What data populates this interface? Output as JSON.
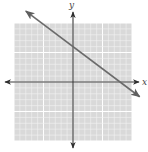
{
  "chart_data": {
    "type": "line",
    "title": "",
    "xlabel": "x",
    "ylabel": "y",
    "xlim": [
      -10,
      10
    ],
    "ylim": [
      -10,
      10
    ],
    "grid": true,
    "grid_minor_step": 1,
    "grid_major_step": 5,
    "tick_labels": false,
    "legend": null,
    "series": [
      {
        "name": "line",
        "equation": "3x + 4y = 24",
        "slope": -0.75,
        "y_intercept": 6,
        "x_intercept": 8,
        "points": [
          {
            "x": -8,
            "y": 12
          },
          {
            "x": 0,
            "y": 6
          },
          {
            "x": 8,
            "y": 0
          },
          {
            "x": 11.3,
            "y": -2.5
          }
        ],
        "arrows_both_ends": true,
        "color": "#6b6b6b"
      }
    ]
  },
  "colors": {
    "grid_background": "#d9d9d9",
    "grid_minor": "#f2f2f2",
    "grid_major": "#ffffff",
    "axis": "#3a3a3a",
    "line": "#6b6b6b"
  }
}
